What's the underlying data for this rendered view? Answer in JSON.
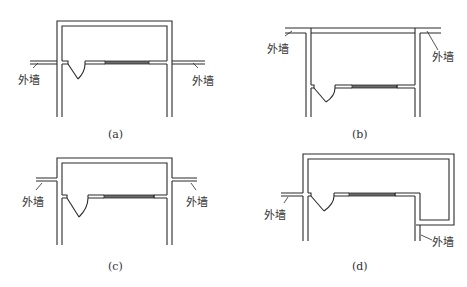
{
  "figure": {
    "panels": [
      {
        "id": "a",
        "caption": "(a)",
        "wall_label_left": "外墙",
        "wall_label_right": "外墙"
      },
      {
        "id": "b",
        "caption": "(b)",
        "wall_label_left": "外墙",
        "wall_label_right": "外墙"
      },
      {
        "id": "c",
        "caption": "(c)",
        "wall_label_left": "外墙",
        "wall_label_right": "外墙"
      },
      {
        "id": "d",
        "caption": "(d)",
        "wall_label_left": "外墙",
        "wall_label_right": "外墙"
      }
    ]
  }
}
